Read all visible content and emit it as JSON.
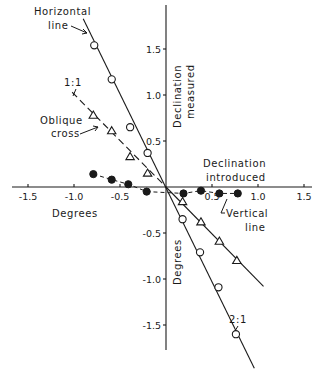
{
  "chart_data": {
    "type": "scatter",
    "title": "",
    "xlabel": "Declination introduced (Degrees)",
    "ylabel": "Declination measured (Degrees)",
    "xlim": [
      -1.7,
      1.65
    ],
    "ylim": [
      -1.75,
      1.95
    ],
    "grid": false,
    "legend": "none (inline annotations)",
    "x_ticks": [
      -1.5,
      -1.0,
      -0.5,
      0.5,
      1.0,
      1.5
    ],
    "x_tick_labels": [
      "-1.5",
      "-1.0",
      "-0.5",
      "0.5",
      "1.0",
      "1.5"
    ],
    "y_ticks": [
      1.5,
      1.0,
      0.5,
      -0.5,
      -1.0,
      -1.5
    ],
    "y_tick_labels": [
      "1.5",
      "1.0",
      "0.5",
      "-0.5",
      "-1.0",
      "-1.5"
    ],
    "series": [
      {
        "name": "Horizontal line",
        "marker": "open-circle",
        "fit_label": "2:1",
        "fit_style": "solid",
        "points": [
          [
            -0.78,
            1.54
          ],
          [
            -0.59,
            1.17
          ],
          [
            -0.39,
            0.65
          ],
          [
            -0.2,
            0.37
          ],
          [
            0.18,
            -0.35
          ],
          [
            0.37,
            -0.71
          ],
          [
            0.57,
            -1.09
          ],
          [
            0.76,
            -1.6
          ]
        ],
        "fit_line": [
          [
            -0.9,
            1.83
          ],
          [
            0.96,
            -1.97
          ]
        ]
      },
      {
        "name": "Oblique cross",
        "marker": "open-triangle",
        "fit_label": "1:1",
        "fit_style": "dashed (negative x) / solid (positive x)",
        "points": [
          [
            -0.79,
            0.78
          ],
          [
            -0.59,
            0.61
          ],
          [
            -0.39,
            0.33
          ],
          [
            -0.2,
            0.15
          ],
          [
            0.18,
            -0.16
          ],
          [
            0.38,
            -0.38
          ],
          [
            0.58,
            -0.59
          ],
          [
            0.77,
            -0.8
          ]
        ],
        "fit_line": [
          [
            -1.02,
            1.03
          ],
          [
            1.06,
            -1.08
          ]
        ]
      },
      {
        "name": "Vertical line",
        "marker": "filled-circle",
        "fit_style": "dashed",
        "points": [
          [
            -0.79,
            0.14
          ],
          [
            -0.59,
            0.08
          ],
          [
            -0.41,
            0.03
          ],
          [
            -0.21,
            -0.05
          ],
          [
            0.19,
            -0.07
          ],
          [
            0.38,
            -0.04
          ],
          [
            0.58,
            -0.07
          ],
          [
            0.78,
            -0.07
          ]
        ],
        "fit_line": [
          [
            -0.79,
            0.14
          ],
          [
            0.78,
            -0.07
          ]
        ]
      }
    ],
    "annotations": [
      {
        "text": "Horizontal",
        "target": "Horizontal line"
      },
      {
        "text": "line",
        "target": "Horizontal line"
      },
      {
        "text": "1:1",
        "target": "Oblique cross fit"
      },
      {
        "text": "Oblique",
        "target": "Oblique cross"
      },
      {
        "text": "cross",
        "target": "Oblique cross"
      },
      {
        "text": "Vertical",
        "target": "Vertical line"
      },
      {
        "text": "line",
        "target": "Vertical line"
      },
      {
        "text": "2:1",
        "target": "Horizontal line fit"
      },
      {
        "text": "Declination",
        "role": "x-axis title line 1"
      },
      {
        "text": "introduced",
        "role": "x-axis title line 2"
      },
      {
        "text": "Degrees",
        "role": "x-axis unit"
      },
      {
        "text": "Declination",
        "role": "y-axis title line 1"
      },
      {
        "text": "measured",
        "role": "y-axis title line 2"
      },
      {
        "text": "Degrees",
        "role": "y-axis unit"
      }
    ]
  },
  "labels": {
    "horizontal_line_1": "Horizontal",
    "horizontal_line_2": "line",
    "ratio_1_1": "1:1",
    "oblique_1": "Oblique",
    "oblique_2": "cross",
    "vertical_1": "Vertical",
    "vertical_2": "line",
    "ratio_2_1": "2:1",
    "x_title_1": "Declination",
    "x_title_2": "introduced",
    "x_unit": "Degrees",
    "y_title_1": "Declination",
    "y_title_2": "measured",
    "y_unit": "Degrees"
  }
}
